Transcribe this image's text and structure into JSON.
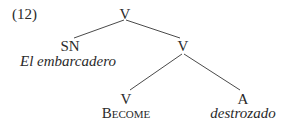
{
  "example_number": "(12)",
  "tree": {
    "root": {
      "label": "V"
    },
    "subject": {
      "label": "SN",
      "gloss": "El embarcadero"
    },
    "vp": {
      "label": "V"
    },
    "verb": {
      "label": "V",
      "gloss": "Become"
    },
    "adj": {
      "label": "A",
      "gloss": "destrozado"
    }
  },
  "colors": {
    "text": "#2a2a2a",
    "edge": "#4a4a4a",
    "background": "#ffffff"
  }
}
